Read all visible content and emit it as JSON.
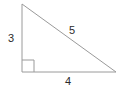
{
  "diagram": {
    "kind": "right-triangle",
    "stroke_color": "#9a9a9a",
    "text_color": "#2b2b2b",
    "background_color": "#ffffff",
    "stroke_width": 1,
    "vertices": {
      "apex": {
        "x": 22,
        "y": 4
      },
      "right_angle": {
        "x": 22,
        "y": 72
      },
      "base_right": {
        "x": 116,
        "y": 72
      }
    },
    "right_angle_marker": {
      "present": true,
      "size": 12,
      "x": 22,
      "y": 60
    },
    "labels": {
      "leg_vertical": "3",
      "hypotenuse": "5",
      "leg_horizontal": "4"
    }
  },
  "chart_data": {
    "type": "diagram",
    "shape": "right triangle",
    "sides": [
      {
        "name": "vertical leg",
        "label": "3",
        "value": 3
      },
      {
        "name": "horizontal leg",
        "label": "4",
        "value": 4
      },
      {
        "name": "hypotenuse",
        "label": "5",
        "value": 5
      }
    ],
    "annotations": [
      "right-angle square at bottom-left vertex"
    ]
  }
}
